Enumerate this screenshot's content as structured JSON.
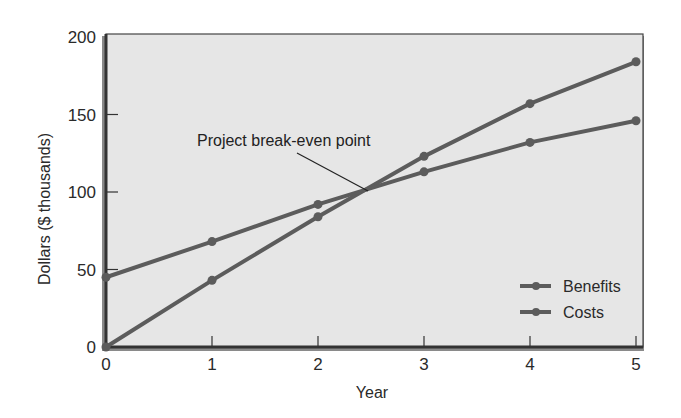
{
  "chart_data": {
    "type": "line",
    "title": "",
    "xlabel": "Year",
    "ylabel": "Dollars ($ thousands)",
    "x": [
      0,
      1,
      2,
      3,
      4,
      5
    ],
    "xticks": [
      "0",
      "1",
      "2",
      "3",
      "4",
      "5"
    ],
    "yticks": [
      "0",
      "50",
      "100",
      "150",
      "200"
    ],
    "xlim": [
      0,
      5
    ],
    "ylim": [
      0,
      200
    ],
    "grid": false,
    "legend_position": "lower right",
    "series": [
      {
        "name": "Benefits",
        "values": [
          0,
          43,
          84,
          123,
          157,
          184
        ]
      },
      {
        "name": "Costs",
        "values": [
          45,
          68,
          92,
          113,
          132,
          146
        ]
      }
    ],
    "annotations": [
      {
        "text": "Project break-even point",
        "x": 2.45,
        "y": 101
      }
    ],
    "colors": {
      "plot_background": "#e6e6e6",
      "line": "#5c5c5c",
      "frame": "#333333"
    }
  }
}
